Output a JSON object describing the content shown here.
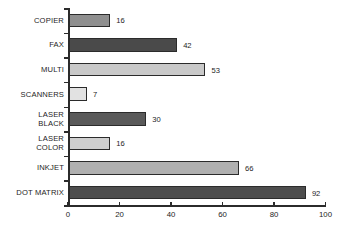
{
  "chart_data": {
    "type": "bar",
    "orientation": "horizontal",
    "title": "",
    "subtitle": "",
    "xlabel": "",
    "ylabel": "",
    "xlim": [
      0,
      100
    ],
    "xticks": [
      0,
      20,
      40,
      60,
      80,
      100
    ],
    "xtick_labels": [
      "0",
      "20",
      "40",
      "60",
      "80",
      "100"
    ],
    "grid": false,
    "legend": false,
    "show_value_labels": true,
    "categories": [
      "COPIER",
      "FAX",
      "MULTI",
      "SCANNERS",
      "LASER BLACK",
      "LASER COLOR",
      "INKJET",
      "DOT MATRIX"
    ],
    "values": [
      16,
      42,
      53,
      7,
      30,
      16,
      66,
      92
    ],
    "value_labels": [
      "16",
      "42",
      "53",
      "7",
      "30",
      "16",
      "66",
      "92"
    ],
    "bars": [
      {
        "category": "COPIER",
        "label_lines": [
          "COPIER"
        ],
        "value": 16,
        "value_label": "16",
        "fill": "#8f8f8f",
        "stroke": "#2b2b2b"
      },
      {
        "category": "FAX",
        "label_lines": [
          "FAX"
        ],
        "value": 42,
        "value_label": "42",
        "fill": "#4a4a4a",
        "stroke": "#2b2b2b"
      },
      {
        "category": "MULTI",
        "label_lines": [
          "MULTI"
        ],
        "value": 53,
        "value_label": "53",
        "fill": "#c9c9c9",
        "stroke": "#2b2b2b"
      },
      {
        "category": "SCANNERS",
        "label_lines": [
          "SCANNERS"
        ],
        "value": 7,
        "value_label": "7",
        "fill": "#e2e2e2",
        "stroke": "#2b2b2b"
      },
      {
        "category": "LASER BLACK",
        "label_lines": [
          "LASER",
          "BLACK"
        ],
        "value": 30,
        "value_label": "30",
        "fill": "#5a5a5a",
        "stroke": "#2b2b2b"
      },
      {
        "category": "LASER COLOR",
        "label_lines": [
          "LASER",
          "COLOR"
        ],
        "value": 16,
        "value_label": "16",
        "fill": "#cfcfcf",
        "stroke": "#2b2b2b"
      },
      {
        "category": "INKJET",
        "label_lines": [
          "INKJET"
        ],
        "value": 66,
        "value_label": "66",
        "fill": "#b0b0b0",
        "stroke": "#2b2b2b"
      },
      {
        "category": "DOT MATRIX",
        "label_lines": [
          "DOT MATRIX"
        ],
        "value": 92,
        "value_label": "92",
        "fill": "#4d4d4d",
        "stroke": "#2b2b2b"
      }
    ],
    "colors": {
      "background": "#ffffff",
      "axis": "#2b2b2b",
      "text": "#1d1d1d"
    }
  }
}
